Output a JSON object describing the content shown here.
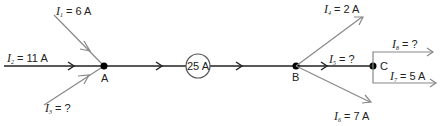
{
  "diagram": {
    "title": "",
    "nodes": {
      "A": {
        "label": "A"
      },
      "B": {
        "label": "B"
      },
      "C": {
        "label": "C"
      }
    },
    "meter": {
      "label": "25 A"
    },
    "currents": [
      {
        "symbol": "I",
        "sub": "1",
        "eq": " = 6 A"
      },
      {
        "symbol": "I",
        "sub": "2",
        "eq": " = 11 A"
      },
      {
        "symbol": "I",
        "sub": "3",
        "eq": " = ?"
      },
      {
        "symbol": "I",
        "sub": "4",
        "eq": " = 2 A"
      },
      {
        "symbol": "I",
        "sub": "5",
        "eq": " = ?"
      },
      {
        "symbol": "I",
        "sub": "6",
        "eq": " = 7 A"
      },
      {
        "symbol": "I",
        "sub": "7",
        "eq": " = 5 A"
      },
      {
        "symbol": "I",
        "sub": "8",
        "eq": " = ?"
      }
    ],
    "colors": {
      "main_wire": "#222222",
      "branch_wire": "#888888",
      "node": "#000000"
    }
  }
}
